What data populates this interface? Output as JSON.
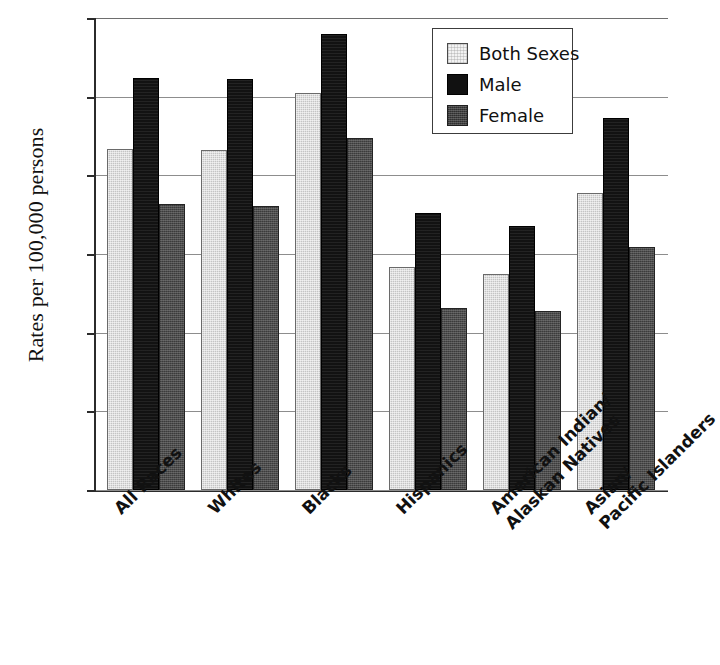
{
  "chart_data": {
    "type": "bar",
    "title": "",
    "xlabel": "",
    "ylabel": "Rates per 100,000 persons",
    "ylim": [
      0,
      60
    ],
    "yticks": [
      0,
      10,
      20,
      30,
      40,
      50,
      60
    ],
    "grid": true,
    "legend_position": "top-right",
    "categories": [
      "All Races",
      "Whites",
      "Blacks",
      "Hispanics",
      "American Indian/\nAlaskan Natives",
      "Asian/\nPacific Islanders"
    ],
    "category_lines": [
      [
        "All Races"
      ],
      [
        "Whites"
      ],
      [
        "Blacks"
      ],
      [
        "Hispanics"
      ],
      [
        "American Indian/",
        "Alaskan Natives"
      ],
      [
        "Asian/",
        "Pacific Islanders"
      ]
    ],
    "series": [
      {
        "name": "Both Sexes",
        "color": "#c4c4c4",
        "values": [
          43.4,
          43.2,
          50.5,
          28.3,
          27.4,
          37.8
        ]
      },
      {
        "name": "Male",
        "color": "#121212",
        "values": [
          52.4,
          52.2,
          58.0,
          35.2,
          33.5,
          47.3
        ]
      },
      {
        "name": "Female",
        "color": "#4c4c4c",
        "values": [
          36.4,
          36.1,
          44.8,
          23.2,
          22.7,
          30.9
        ]
      }
    ]
  },
  "axis": {
    "y_title": "Rates per 100,000 persons",
    "y_tick_labels": [
      "60",
      "50",
      "40",
      "30",
      "20",
      "10",
      "0"
    ]
  },
  "legend": {
    "entries": [
      {
        "label": "Both Sexes"
      },
      {
        "label": "Male"
      },
      {
        "label": "Female"
      }
    ]
  }
}
